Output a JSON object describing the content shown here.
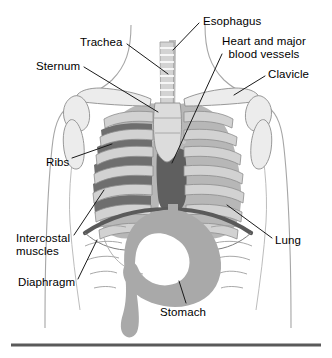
{
  "figure": {
    "type": "anatomical-diagram",
    "background_color": "#ffffff",
    "rule": {
      "name": "bottom-divider",
      "color": "#5a5a5a",
      "x1": 11,
      "x2": 321,
      "y": 345,
      "thickness": 3
    },
    "palette": {
      "outline": "#9a9a9a",
      "bone_fill": "#d9d9d9",
      "bone_stroke": "#8a8a8a",
      "lung_fill": "#b7b7b7",
      "rib_fill": "#d2d2d2",
      "intercostal_dark": "#6e6e6e",
      "heart_dark": "#5f5f5f",
      "diaphragm_dark": "#5a5a5a",
      "stomach_fill": "#a9a9a9",
      "trachea_fill": "#cfcfcf",
      "leader_line": "#1a1a1a",
      "text": "#000000"
    }
  },
  "labels": [
    {
      "id": "trachea",
      "text": "Trachea",
      "x": 80,
      "y": 36,
      "align": "left",
      "leader": {
        "x1": 127,
        "y1": 44,
        "x2": 168,
        "y2": 74
      }
    },
    {
      "id": "esophagus",
      "text": "Esophagus",
      "x": 203,
      "y": 15,
      "align": "left",
      "leader": {
        "x1": 199,
        "y1": 23,
        "x2": 173,
        "y2": 50
      }
    },
    {
      "id": "heart-and-major-blood-vessels",
      "text": "Heart and major\nblood vessels",
      "x": 222,
      "y": 35,
      "align": "left",
      "leader": {
        "x1": 222,
        "y1": 54,
        "x2": 172,
        "y2": 163
      }
    },
    {
      "id": "sternum",
      "text": "Sternum",
      "x": 36,
      "y": 60,
      "align": "left",
      "leader": {
        "x1": 84,
        "y1": 67,
        "x2": 158,
        "y2": 112
      }
    },
    {
      "id": "clavicle",
      "text": "Clavicle",
      "x": 268,
      "y": 68,
      "align": "left",
      "leader": {
        "x1": 265,
        "y1": 76,
        "x2": 234,
        "y2": 95
      }
    },
    {
      "id": "ribs",
      "text": "Ribs",
      "x": 46,
      "y": 156,
      "align": "left",
      "leader": {
        "x1": 72,
        "y1": 158,
        "x2": 112,
        "y2": 144
      }
    },
    {
      "id": "lung",
      "text": "Lung",
      "x": 275,
      "y": 234,
      "align": "left",
      "leader": {
        "x1": 272,
        "y1": 238,
        "x2": 227,
        "y2": 205
      }
    },
    {
      "id": "intercostal-muscles",
      "text": "Intercostal\nmuscles",
      "x": 16,
      "y": 232,
      "align": "left",
      "leader": {
        "x1": 74,
        "y1": 235,
        "x2": 104,
        "y2": 190
      }
    },
    {
      "id": "diaphragm",
      "text": "Diaphragm",
      "x": 18,
      "y": 276,
      "align": "left",
      "leader": {
        "x1": 78,
        "y1": 279,
        "x2": 97,
        "y2": 240
      }
    },
    {
      "id": "stomach",
      "text": "Stomach",
      "x": 160,
      "y": 306,
      "align": "left",
      "leader": {
        "x1": 186,
        "y1": 303,
        "x2": 179,
        "y2": 281
      }
    }
  ]
}
